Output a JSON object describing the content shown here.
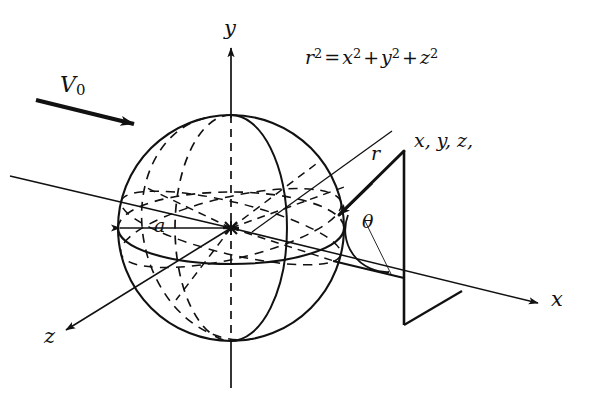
{
  "figure": {
    "background_color": "#ffffff",
    "stroke_color": "#111111",
    "width": 598,
    "height": 410
  },
  "equation": {
    "lhs_var": "r",
    "lhs_exp": "2",
    "equals": "=",
    "terms": [
      {
        "var": "x",
        "exp": "2"
      },
      {
        "var": "y",
        "exp": "2"
      },
      {
        "var": "z",
        "exp": "2"
      }
    ],
    "plus": "+",
    "full_text": "r² = x² + y² + z²"
  },
  "labels": {
    "y_axis": "y",
    "x_axis": "x",
    "z_axis": "z",
    "radius": "a",
    "r_vector": "r",
    "theta": "θ",
    "velocity": "V",
    "velocity_sub": "0",
    "coords": "x, y, z,"
  },
  "elements": {
    "sphere_name": "sphere",
    "equator_name": "equator-ellipse",
    "meridian_name": "meridian-ellipse",
    "center_name": "origin-point",
    "wedge_name": "coordinate-plane-wedge",
    "arc_name": "theta-arc",
    "flow_arrow_name": "freestream-velocity-arrow"
  },
  "geometry": {
    "sphere_center_x": 231,
    "sphere_center_y": 228,
    "sphere_radius": 113
  }
}
